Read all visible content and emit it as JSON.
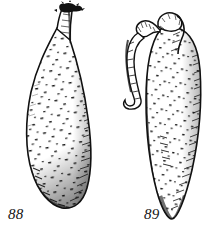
{
  "plate": {
    "kind": "scientific-line-drawing",
    "background_color": "#ffffff",
    "ink_color": "#111111",
    "width": 215,
    "height": 232,
    "caption_style": "italic-serif-numeral"
  },
  "figures": [
    {
      "id": "88",
      "label": "88",
      "label_position": {
        "x": 8,
        "y": 207
      },
      "description": "elongated curved pod-shaped specimen with a narrow tapering stalk at the upper right ending in a dark frayed tip; body widest below middle, rounded at the lower end",
      "orientation": "tilted, stalk up-right, body down-left",
      "texture": "fine stipple of short dark dashes with dense hatched shading along the right and lower-left margins",
      "outline_color": "#111111",
      "fill_color": "#ffffff"
    },
    {
      "id": "89",
      "label": "89",
      "label_position": {
        "x": 144,
        "y": 207
      },
      "description": "elongated pod-shaped specimen with a hooked knob-tipped neck curving over at the top and a narrow ribbon-like appendage hanging down on its left side; body tapers to a pointed lower tip",
      "orientation": "nearly vertical, hook at top bending left",
      "texture": "fine stipple of short dark dashes with dense hatching along the right margin and the lower tip",
      "outline_color": "#111111",
      "fill_color": "#ffffff"
    }
  ]
}
